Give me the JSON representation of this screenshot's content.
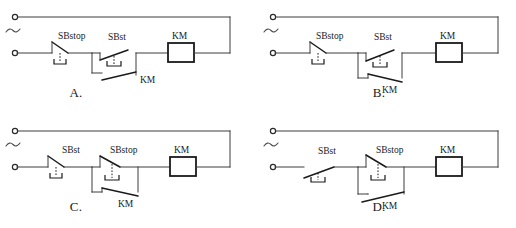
{
  "page": {
    "background_color": "#ffffff",
    "line_color": "#3c3c3c",
    "text_color": "#1a1a1a"
  },
  "options": [
    {
      "id": "A",
      "label": "A.",
      "source_symbol": "~",
      "first_switch": {
        "label": "SBstop",
        "type": "normally-closed"
      },
      "second_switch": {
        "label": "SBst",
        "type": "normally-open"
      },
      "holding_contact": {
        "label": "KM",
        "type": "normally-open",
        "blade_direction": "up-right"
      },
      "coil": {
        "label": "KM"
      }
    },
    {
      "id": "B",
      "label": "B.",
      "source_symbol": "~",
      "first_switch": {
        "label": "SBstop",
        "type": "normally-closed"
      },
      "second_switch": {
        "label": "SBst",
        "type": "normally-open"
      },
      "holding_contact": {
        "label": "KM",
        "type": "normally-open",
        "blade_direction": "down-right"
      },
      "coil": {
        "label": "KM"
      }
    },
    {
      "id": "C",
      "label": "C.",
      "source_symbol": "~",
      "first_switch": {
        "label": "SBst",
        "type": "normally-closed"
      },
      "second_switch": {
        "label": "SBstop",
        "type": "normally-closed"
      },
      "holding_contact": {
        "label": "KM",
        "type": "normally-open",
        "blade_direction": "down-right"
      },
      "coil": {
        "label": "KM"
      }
    },
    {
      "id": "D",
      "label": "D.",
      "source_symbol": "~",
      "first_switch": {
        "label": "SBst",
        "type": "normally-open"
      },
      "second_switch": {
        "label": "SBstop",
        "type": "normally-closed"
      },
      "holding_contact": {
        "label": "KM",
        "type": "normally-open",
        "blade_direction": "up-right"
      },
      "coil": {
        "label": "KM"
      }
    }
  ]
}
